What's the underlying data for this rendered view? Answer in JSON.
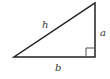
{
  "diagram": {
    "labels": {
      "hypotenuse": "h",
      "vertical_leg": "a",
      "horizontal_leg": "b"
    },
    "right_angle_marker": true,
    "colors": {
      "stroke": "#222222",
      "marker": "#555555",
      "text": "#333333"
    }
  }
}
